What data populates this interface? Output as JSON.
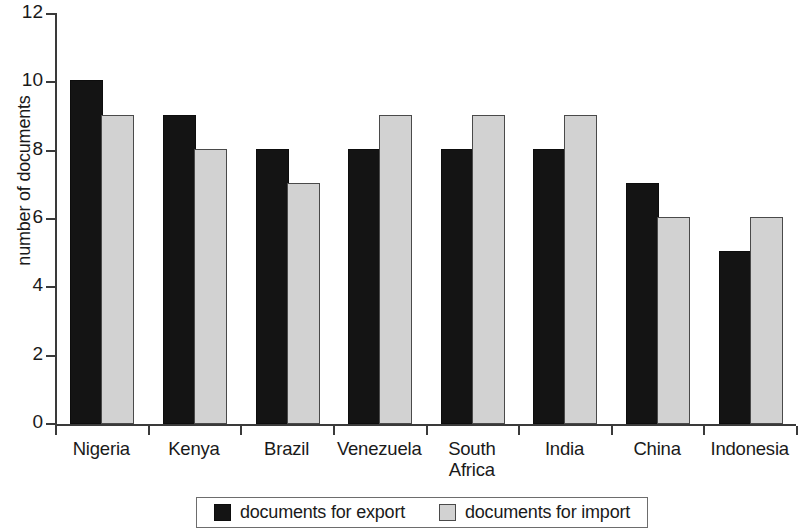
{
  "chart_data": {
    "type": "bar",
    "title": "",
    "xlabel": "",
    "ylabel": "number of documents",
    "ylim": [
      0,
      12
    ],
    "yticks": [
      0,
      2,
      4,
      6,
      8,
      10,
      12
    ],
    "grid": false,
    "legend_position": "bottom",
    "categories": [
      "Nigeria",
      "Kenya",
      "Brazil",
      "Venezuela",
      "South Africa",
      "India",
      "China",
      "Indonesia"
    ],
    "category_label_lines": [
      [
        "Nigeria"
      ],
      [
        "Kenya"
      ],
      [
        "Brazil"
      ],
      [
        "Venezuela"
      ],
      [
        "South",
        "Africa"
      ],
      [
        "India"
      ],
      [
        "China"
      ],
      [
        "Indonesia"
      ]
    ],
    "series": [
      {
        "name": "documents for export",
        "color": "#141414",
        "values": [
          10,
          9,
          8,
          8,
          8,
          8,
          7,
          5
        ]
      },
      {
        "name": "documents for import",
        "color": "#d2d2d2",
        "values": [
          9,
          8,
          7,
          9,
          9,
          9,
          6,
          6
        ]
      }
    ]
  },
  "legend": {
    "entries": [
      {
        "label": "documents for export",
        "swatch": "black-square-icon"
      },
      {
        "label": "documents for import",
        "swatch": "gray-square-icon"
      }
    ]
  },
  "axis": {
    "y_title": "number of documents",
    "y_tick_labels": [
      "0",
      "2",
      "4",
      "6",
      "8",
      "10",
      "12"
    ]
  }
}
